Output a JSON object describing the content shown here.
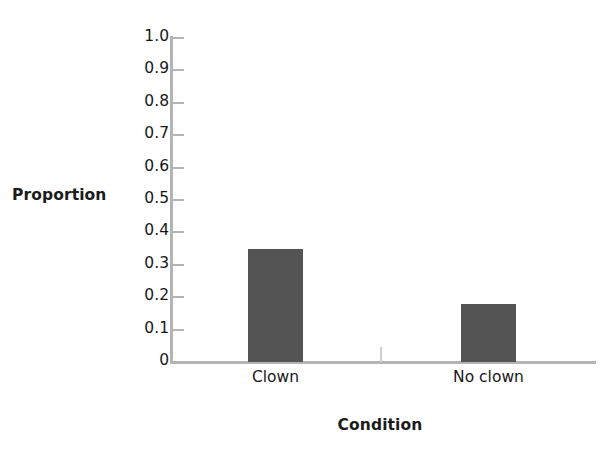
{
  "chart_data": {
    "type": "bar",
    "title": "",
    "subtitle": "",
    "xlabel": "Condition",
    "ylabel": "Proportion",
    "categories": [
      "Clown",
      "No clown"
    ],
    "values": [
      0.35,
      0.18
    ],
    "series": [
      {
        "name": "Proportion",
        "values": [
          0.35,
          0.18
        ]
      }
    ],
    "ylim": [
      0,
      1.0
    ],
    "ytick_labels": [
      "1.0",
      "0.9",
      "0.8",
      "0.7",
      "0.6",
      "0.5",
      "0.4",
      "0.3",
      "0.2",
      "0.1",
      "0"
    ],
    "ytick_values": [
      1.0,
      0.9,
      0.8,
      0.7,
      0.6,
      0.5,
      0.4,
      0.3,
      0.2,
      0.1,
      0
    ],
    "grid": false,
    "legend": false,
    "legend_position": "none",
    "annotations": [],
    "colors": {
      "bar": "#545454",
      "axis": "#b4b4b4",
      "text": "#17171a",
      "background": "#ffffff"
    }
  }
}
